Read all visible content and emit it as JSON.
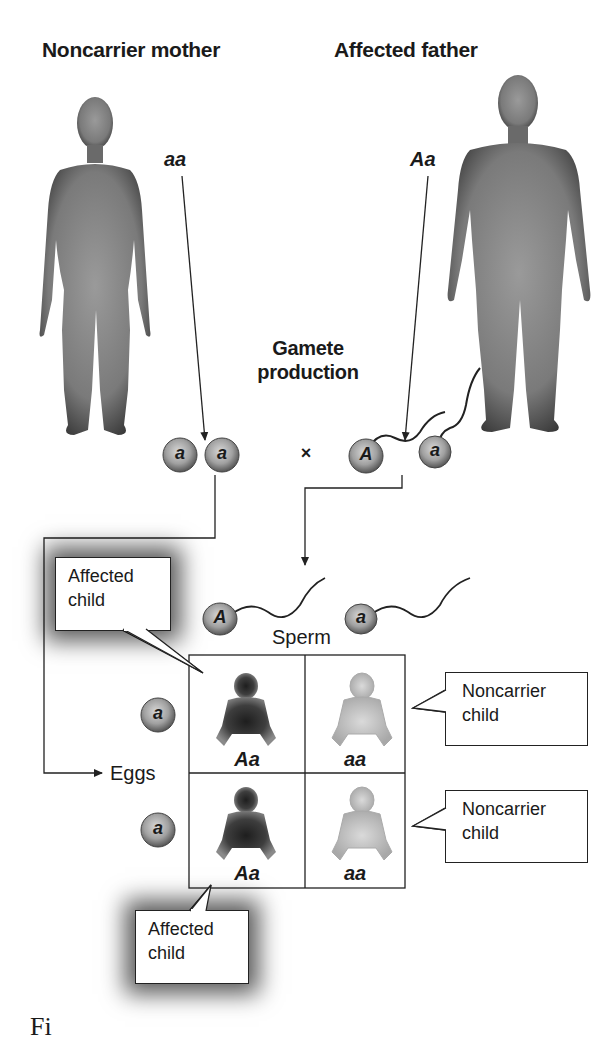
{
  "parents": {
    "mother": {
      "title": "Noncarrier mother",
      "genotype": "aa"
    },
    "father": {
      "title": "Affected father",
      "genotype": "Aa"
    }
  },
  "gamete_production": {
    "line1": "Gamete",
    "line2": "production"
  },
  "gametes": {
    "eggs": [
      "a",
      "a"
    ],
    "cross_symbol": "×",
    "sperm": [
      "A",
      "a"
    ]
  },
  "punnett": {
    "sperm_label": "Sperm",
    "eggs_label": "Eggs",
    "sperm_alleles": [
      "A",
      "a"
    ],
    "egg_alleles": [
      "a",
      "a"
    ],
    "cells": [
      {
        "genotype": "Aa",
        "phenotype": "affected"
      },
      {
        "genotype": "aa",
        "phenotype": "noncarrier"
      },
      {
        "genotype": "Aa",
        "phenotype": "affected"
      },
      {
        "genotype": "aa",
        "phenotype": "noncarrier"
      }
    ]
  },
  "callouts": {
    "affected_top": {
      "line1": "Affected",
      "line2": "child"
    },
    "noncarrier_top": {
      "line1": "Noncarrier",
      "line2": "child"
    },
    "noncarrier_bottom": {
      "line1": "Noncarrier",
      "line2": "child"
    },
    "affected_bottom": {
      "line1": "Affected",
      "line2": "child"
    }
  },
  "caption_fragment": "Fi",
  "colors": {
    "figure_dark": "#3c3c3c",
    "figure_light": "#8a8a8a",
    "baby_light": "#c9c9c9",
    "gamete_fill": "#9a9a9a",
    "line": "#222222"
  }
}
